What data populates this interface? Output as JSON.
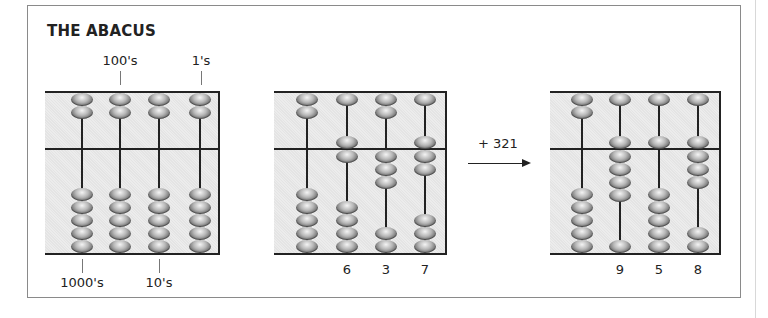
{
  "title": "THE ABACUS",
  "place_labels": {
    "top": [
      "100's",
      "1's"
    ],
    "bottom": [
      "1000's",
      "10's"
    ]
  },
  "operation": {
    "label": "+ 321",
    "icon": "arrow-right-icon"
  },
  "abaci": [
    {
      "name": "reference-abacus",
      "digits": [
        0,
        0,
        0,
        0
      ],
      "digit_labels": []
    },
    {
      "name": "before-abacus",
      "digits": [
        0,
        6,
        3,
        7
      ],
      "digit_labels": [
        "6",
        "3",
        "7"
      ]
    },
    {
      "name": "after-abacus",
      "digits": [
        0,
        9,
        5,
        8
      ],
      "digit_labels": [
        "9",
        "5",
        "8"
      ]
    }
  ],
  "bead_config": {
    "upper_beads_per_rod": 2,
    "lower_beads_per_rod": 5,
    "upper_value": 5,
    "lower_value": 1
  }
}
